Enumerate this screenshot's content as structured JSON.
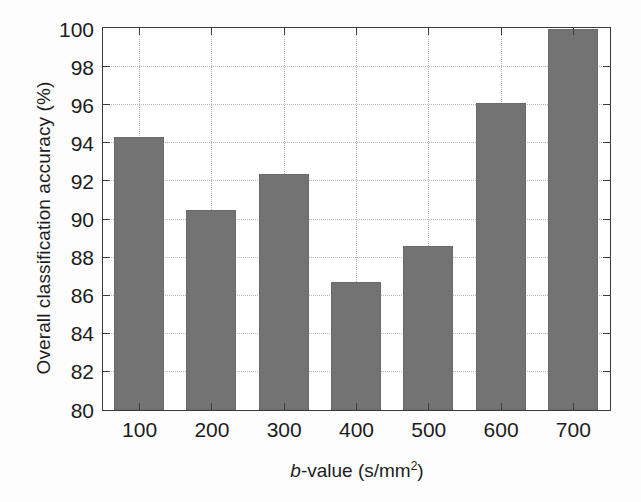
{
  "chart_data": {
    "type": "bar",
    "title": "",
    "subtitle": "",
    "xlabel": "b-value (s/mm2)",
    "xlabel_parts": {
      "italic": "b",
      "rest": "-value (s/mm",
      "superscript": "2",
      "close": ")"
    },
    "ylabel": "Overall classification accuracy (%)",
    "categories": [
      "100",
      "200",
      "300",
      "400",
      "500",
      "600",
      "700"
    ],
    "values": [
      94.35,
      90.5,
      92.4,
      86.7,
      88.6,
      96.1,
      100.0
    ],
    "series": [
      {
        "name": "Overall classification accuracy",
        "values": [
          94.35,
          90.5,
          92.4,
          86.7,
          88.6,
          96.1,
          100.0
        ]
      }
    ],
    "ylim": [
      80,
      100
    ],
    "yticks": [
      80,
      82,
      84,
      86,
      88,
      90,
      92,
      94,
      96,
      98,
      100
    ],
    "ytick_labels": [
      "80",
      "82",
      "84",
      "86",
      "88",
      "90",
      "92",
      "94",
      "96",
      "98",
      "100"
    ],
    "xtick_labels": [
      "100",
      "200",
      "300",
      "400",
      "500",
      "600",
      "700"
    ],
    "grid": true,
    "grid_style": "dotted",
    "legend": null,
    "legend_position": "none",
    "bar_color": "#737373",
    "bar_edge_color": "#6b6b6b",
    "grid_color": "#b9b9b9",
    "axis_color": "#3a3a3a",
    "background_color": "#ffffff",
    "text_color": "#1c1c1c",
    "bar_width_fraction": 0.69
  }
}
